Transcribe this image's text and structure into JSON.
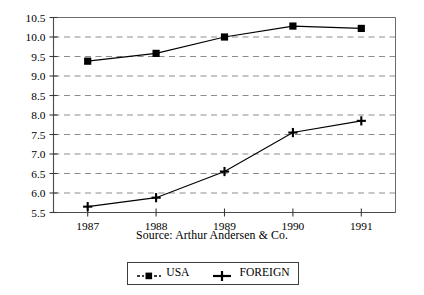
{
  "chart_data": {
    "type": "line",
    "title": "",
    "subtitle": "",
    "xlabel": "",
    "ylabel": "",
    "categories": [
      "1987",
      "1988",
      "1989",
      "1990",
      "1991"
    ],
    "x": [
      1987,
      1988,
      1989,
      1990,
      1991
    ],
    "series": [
      {
        "name": "USA",
        "marker": "square",
        "values": [
          9.38,
          9.58,
          10.0,
          10.28,
          10.22
        ]
      },
      {
        "name": "FOREIGN",
        "marker": "cross",
        "values": [
          5.65,
          5.88,
          6.55,
          7.55,
          7.85
        ]
      }
    ],
    "ylim": [
      5.5,
      10.5
    ],
    "ytick_labels": [
      "10.5",
      "10.0",
      "9.5",
      "9.0",
      "8.5",
      "8.0",
      "7.5",
      "7.0",
      "6.5",
      "6.0",
      "5.5"
    ],
    "ytick_values": [
      10.5,
      10.0,
      9.5,
      9.0,
      8.5,
      8.0,
      7.5,
      7.0,
      6.5,
      6.0,
      5.5
    ],
    "xtick_labels": [
      "1987",
      "1988",
      "1989",
      "1990",
      "1991"
    ],
    "grid": "horizontal-dashed",
    "legend_position": "bottom-center",
    "legend_entries": [
      "USA",
      "FOREIGN"
    ],
    "annotations": [
      "Source: Arthur Andersen & Co."
    ],
    "line_color": "#000000",
    "grid_color": "#8d8d8d",
    "axis_color": "#4a4a4a"
  },
  "source_note": "Source: Arthur Andersen & Co.",
  "legend": {
    "usa_label": "USA",
    "foreign_label": "FOREIGN"
  }
}
